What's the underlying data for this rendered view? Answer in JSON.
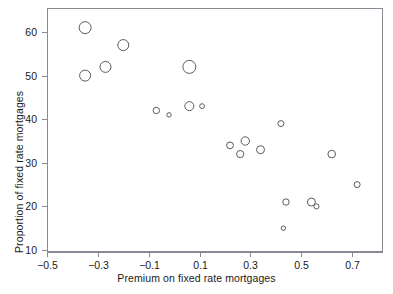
{
  "chart_data": {
    "type": "scatter",
    "title": "",
    "xlabel": "Premium on fixed rate mortgages",
    "ylabel": "Proportion of fixed rate mortgages",
    "xlim": [
      -0.55,
      0.82
    ],
    "ylim": [
      10,
      64
    ],
    "xticks": [
      -0.5,
      -0.3,
      -0.1,
      0.1,
      0.3,
      0.5,
      0.7
    ],
    "xticklabels": [
      "-0.5",
      "-0.3",
      "-0.1",
      "0.1",
      "0.3",
      "0.5",
      "0.7"
    ],
    "yticks": [
      10,
      20,
      30,
      40,
      50,
      60
    ],
    "yticklabels": [
      "10",
      "20",
      "30",
      "40",
      "50",
      "60"
    ],
    "grid": false,
    "legend": null,
    "marker": "open-circle",
    "note": "Bubble sizes vary by weight; radius given in px",
    "points": [
      {
        "x": -0.35,
        "y": 61,
        "r": 6.0
      },
      {
        "x": -0.35,
        "y": 50,
        "r": 5.5
      },
      {
        "x": -0.27,
        "y": 52,
        "r": 5.5
      },
      {
        "x": -0.2,
        "y": 57,
        "r": 5.5
      },
      {
        "x": -0.07,
        "y": 42,
        "r": 3.2
      },
      {
        "x": -0.02,
        "y": 41,
        "r": 2.2
      },
      {
        "x": 0.06,
        "y": 52,
        "r": 6.5
      },
      {
        "x": 0.06,
        "y": 43,
        "r": 4.5
      },
      {
        "x": 0.11,
        "y": 43,
        "r": 2.4
      },
      {
        "x": 0.22,
        "y": 34,
        "r": 3.4
      },
      {
        "x": 0.26,
        "y": 32,
        "r": 3.6
      },
      {
        "x": 0.28,
        "y": 35,
        "r": 4.2
      },
      {
        "x": 0.34,
        "y": 33,
        "r": 4.0
      },
      {
        "x": 0.42,
        "y": 39,
        "r": 3.0
      },
      {
        "x": 0.44,
        "y": 21,
        "r": 3.2
      },
      {
        "x": 0.43,
        "y": 15,
        "r": 2.2
      },
      {
        "x": 0.54,
        "y": 21,
        "r": 4.0
      },
      {
        "x": 0.56,
        "y": 20,
        "r": 2.6
      },
      {
        "x": 0.62,
        "y": 32,
        "r": 3.8
      },
      {
        "x": 0.72,
        "y": 25,
        "r": 3.0
      }
    ]
  },
  "axes": {
    "frame_color": "#8a8a92",
    "marker_color": "#5a5a63",
    "text_color": "#1a1a1a"
  }
}
